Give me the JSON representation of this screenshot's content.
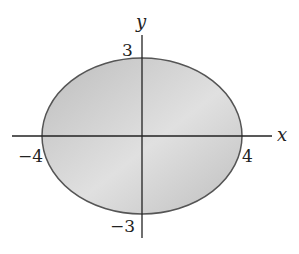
{
  "diagram": {
    "type": "ellipse-on-axes",
    "equation_params": {
      "a": 4,
      "b": 3
    },
    "axes": {
      "x_label": "x",
      "y_label": "y"
    },
    "ticks": {
      "x_neg": "−4",
      "x_pos": "4",
      "y_pos": "3",
      "y_neg": "−3"
    },
    "colors": {
      "fill": "#c8c8c8",
      "stroke": "#555555",
      "axis": "#222222"
    }
  }
}
